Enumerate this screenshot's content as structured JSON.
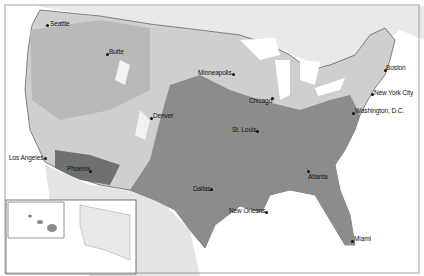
{
  "map": {
    "title": "",
    "colors": {
      "water": "#ffffff",
      "canada": "#e9e9e9",
      "mexico": "#e4e4e4",
      "zone_light": "#cfcfcf",
      "zone_medium": "#a9a9a9",
      "zone_dark": "#8c8c8c",
      "zone_darkest": "#6e6e6e",
      "highland": "#f2f2f2",
      "border": "#3a3a3a"
    },
    "cities": [
      {
        "name": "Seattle",
        "x": 47,
        "y": 21,
        "dot_x": 46,
        "dot_y": 24,
        "label_side": "right"
      },
      {
        "name": "Butte",
        "x": 109,
        "y": 49,
        "dot_x": 106,
        "dot_y": 53,
        "label_side": "right"
      },
      {
        "name": "Minneapolis",
        "x": 198,
        "y": 70,
        "dot_x": 232,
        "dot_y": 73,
        "label_side": "left"
      },
      {
        "name": "Boston",
        "x": 386,
        "y": 65,
        "dot_x": 384,
        "dot_y": 69,
        "label_side": "right"
      },
      {
        "name": "New York City",
        "x": 373,
        "y": 90,
        "dot_x": 371,
        "dot_y": 93,
        "label_side": "right"
      },
      {
        "name": "Chicago",
        "x": 249,
        "y": 98,
        "dot_x": 271,
        "dot_y": 97,
        "label_side": "left"
      },
      {
        "name": "Washington, D.C.",
        "x": 355,
        "y": 108,
        "dot_x": 352,
        "dot_y": 112,
        "label_side": "right"
      },
      {
        "name": "Denver",
        "x": 153,
        "y": 113,
        "dot_x": 150,
        "dot_y": 117,
        "label_side": "right"
      },
      {
        "name": "St. Louis",
        "x": 232,
        "y": 127,
        "dot_x": 256,
        "dot_y": 130,
        "label_side": "left"
      },
      {
        "name": "Los Angeles",
        "x": 9,
        "y": 155,
        "dot_x": 44,
        "dot_y": 157,
        "label_side": "left"
      },
      {
        "name": "Phoenix",
        "x": 67,
        "y": 166,
        "dot_x": 89,
        "dot_y": 170,
        "label_side": "left"
      },
      {
        "name": "Dallas",
        "x": 193,
        "y": 186,
        "dot_x": 210,
        "dot_y": 188,
        "label_side": "left"
      },
      {
        "name": "Atlanta",
        "x": 307,
        "y": 172,
        "dot_x": 307,
        "dot_y": 170,
        "label_side": "right"
      },
      {
        "name": "New Orleans",
        "x": 229,
        "y": 208,
        "dot_x": 265,
        "dot_y": 211,
        "label_side": "left"
      },
      {
        "name": "Miami",
        "x": 354,
        "y": 236,
        "dot_x": 351,
        "dot_y": 240,
        "label_side": "right"
      }
    ]
  }
}
